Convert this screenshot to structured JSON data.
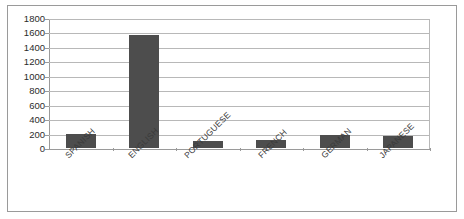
{
  "chart_data": {
    "type": "bar",
    "title": "",
    "xlabel": "",
    "ylabel": "",
    "categories": [
      "SPANISH",
      "ENGLISH",
      "PORTUGUESE",
      "FRENCH",
      "GERMAN",
      "JAPANESE"
    ],
    "values": [
      200,
      1570,
      95,
      110,
      175,
      160
    ],
    "ylim": [
      0,
      1800
    ],
    "ytick_values": [
      0,
      200,
      400,
      600,
      800,
      1000,
      1200,
      1400,
      1600,
      1800
    ],
    "ytick_labels": [
      "0",
      "200",
      "400",
      "600",
      "800",
      "1000",
      "1200",
      "1400",
      "1600",
      "1800"
    ],
    "grid": true,
    "legend": false,
    "legend_position": "none",
    "series": [
      {
        "name": "",
        "values": [
          200,
          1570,
          95,
          110,
          175,
          160
        ]
      }
    ],
    "colors": {
      "bar_fill": "#4d4d4d",
      "gridline": "#b8b8b8",
      "axis": "#9a9a9a",
      "text": "#2b2b2b",
      "background": "#ffffff",
      "frame_border": "#9a9a9a"
    }
  }
}
